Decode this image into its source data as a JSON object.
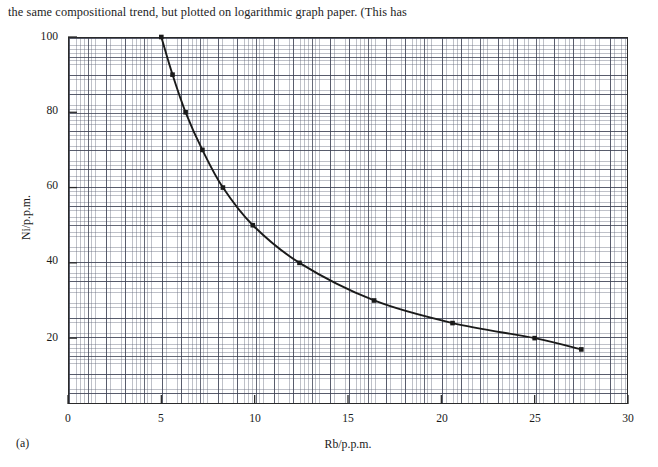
{
  "caption": {
    "text": "the same compositional trend, but plotted on logarithmic graph paper. (This has"
  },
  "figure": {
    "panel_label": "(a)"
  },
  "chart_data": {
    "type": "line",
    "title": "",
    "subtitle": "",
    "xlabel": "Rb/p.p.m.",
    "ylabel": "Ni/p.p.m.",
    "xlim": [
      0,
      30
    ],
    "ylim": [
      2.5,
      100
    ],
    "xticks": [
      0,
      5,
      10,
      15,
      20,
      25,
      30
    ],
    "xtick_labels": [
      "0",
      "5",
      "10",
      "15",
      "20",
      "25",
      "30"
    ],
    "yticks": [
      20,
      40,
      60,
      80,
      100
    ],
    "ytick_labels": [
      "20",
      "40",
      "60",
      "80",
      "100"
    ],
    "grid": true,
    "grid_style": "graph-paper-fine-and-major",
    "legend": null,
    "marker": "filled-square",
    "line_style": "solid",
    "line_color": "#1a1a1a",
    "series": [
      {
        "name": "Ni vs Rb",
        "x": [
          5.0,
          5.6,
          6.3,
          7.2,
          8.3,
          9.9,
          12.4,
          16.4,
          20.6,
          25.0,
          27.5
        ],
        "y": [
          100,
          90,
          80,
          70,
          60,
          50,
          40,
          30,
          24,
          20,
          17
        ]
      }
    ],
    "annotations": []
  }
}
